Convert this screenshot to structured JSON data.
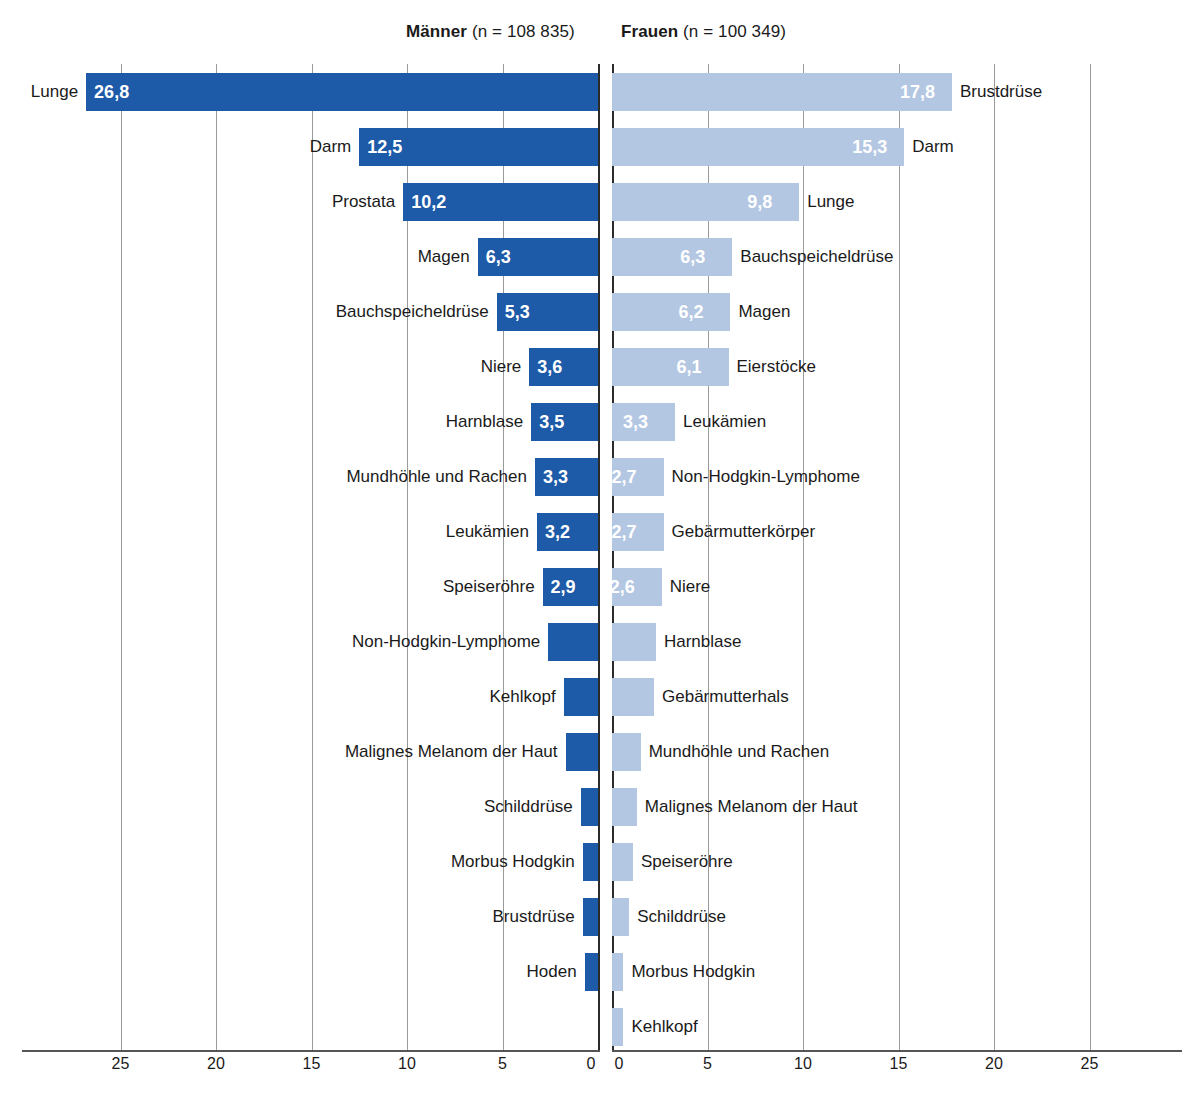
{
  "headers": {
    "left": {
      "who": "Männer",
      "n": "(n = 108 835)"
    },
    "right": {
      "who": "Frauen",
      "n": "(n = 100 349)"
    }
  },
  "axis": {
    "left_ticks": [
      "25",
      "20",
      "15",
      "10",
      "5",
      "0"
    ],
    "right_ticks": [
      "0",
      "5",
      "10",
      "15",
      "20",
      "25"
    ],
    "tick_values": [
      25,
      20,
      15,
      10,
      5,
      0
    ],
    "max": 28
  },
  "colors": {
    "male_bar": "#1d5aa8",
    "female_bar": "#b4c7e2",
    "grid": "#9a9a9a",
    "axis": "#2b2b2b",
    "text": "#1a1a1a"
  },
  "chart_data": {
    "type": "bar",
    "orientation": "horizontal-diverging",
    "title": "",
    "xlabel": "",
    "ylabel": "",
    "xlim": [
      0,
      28
    ],
    "grid": true,
    "legend_position": "top",
    "series": [
      {
        "name": "Männer",
        "n": "108 835",
        "side": "left",
        "color": "#1d5aa8",
        "points": [
          {
            "label": "Lunge",
            "value": 26.8,
            "value_text": "26,8",
            "label_shown": true
          },
          {
            "label": "Darm",
            "value": 12.5,
            "value_text": "12,5",
            "label_shown": true
          },
          {
            "label": "Prostata",
            "value": 10.2,
            "value_text": "10,2",
            "label_shown": true
          },
          {
            "label": "Magen",
            "value": 6.3,
            "value_text": "6,3",
            "label_shown": true
          },
          {
            "label": "Bauchspeicheldrüse",
            "value": 5.3,
            "value_text": "5,3",
            "label_shown": true
          },
          {
            "label": "Niere",
            "value": 3.6,
            "value_text": "3,6",
            "label_shown": true
          },
          {
            "label": "Harnblase",
            "value": 3.5,
            "value_text": "3,5",
            "label_shown": true
          },
          {
            "label": "Mundhöhle und Rachen",
            "value": 3.3,
            "value_text": "3,3",
            "label_shown": true
          },
          {
            "label": "Leukämien",
            "value": 3.2,
            "value_text": "3,2",
            "label_shown": true
          },
          {
            "label": "Speiseröhre",
            "value": 2.9,
            "value_text": "2,9",
            "label_shown": true
          },
          {
            "label": "Non-Hodgkin-Lymphome",
            "value": 2.6,
            "value_text": "",
            "label_shown": false
          },
          {
            "label": "Kehlkopf",
            "value": 1.8,
            "value_text": "",
            "label_shown": false
          },
          {
            "label": "Malignes Melanom der Haut",
            "value": 1.7,
            "value_text": "",
            "label_shown": false
          },
          {
            "label": "Schilddrüse",
            "value": 0.9,
            "value_text": "",
            "label_shown": false
          },
          {
            "label": "Morbus Hodgkin",
            "value": 0.8,
            "value_text": "",
            "label_shown": false
          },
          {
            "label": "Brustdrüse",
            "value": 0.8,
            "value_text": "",
            "label_shown": false
          },
          {
            "label": "Hoden",
            "value": 0.7,
            "value_text": "",
            "label_shown": false
          }
        ]
      },
      {
        "name": "Frauen",
        "n": "100 349",
        "side": "right",
        "color": "#b4c7e2",
        "points": [
          {
            "label": "Brustdrüse",
            "value": 17.8,
            "value_text": "17,8",
            "label_shown": true
          },
          {
            "label": "Darm",
            "value": 15.3,
            "value_text": "15,3",
            "label_shown": true
          },
          {
            "label": "Lunge",
            "value": 9.8,
            "value_text": "9,8",
            "label_shown": true
          },
          {
            "label": "Bauchspeicheldrüse",
            "value": 6.3,
            "value_text": "6,3",
            "label_shown": true
          },
          {
            "label": "Magen",
            "value": 6.2,
            "value_text": "6,2",
            "label_shown": true
          },
          {
            "label": "Eierstöcke",
            "value": 6.1,
            "value_text": "6,1",
            "label_shown": true
          },
          {
            "label": "Leukämien",
            "value": 3.3,
            "value_text": "3,3",
            "label_shown": true
          },
          {
            "label": "Non-Hodgkin-Lymphome",
            "value": 2.7,
            "value_text": "2,7",
            "label_shown": true
          },
          {
            "label": "Gebärmutterkörper",
            "value": 2.7,
            "value_text": "2,7",
            "label_shown": true
          },
          {
            "label": "Niere",
            "value": 2.6,
            "value_text": "2,6",
            "label_shown": true
          },
          {
            "label": "Harnblase",
            "value": 2.3,
            "value_text": "",
            "label_shown": false
          },
          {
            "label": "Gebärmutterhals",
            "value": 2.2,
            "value_text": "",
            "label_shown": false
          },
          {
            "label": "Mundhöhle und Rachen",
            "value": 1.5,
            "value_text": "",
            "label_shown": false
          },
          {
            "label": "Malignes Melanom der Haut",
            "value": 1.3,
            "value_text": "",
            "label_shown": false
          },
          {
            "label": "Speiseröhre",
            "value": 1.1,
            "value_text": "",
            "label_shown": false
          },
          {
            "label": "Schilddrüse",
            "value": 0.9,
            "value_text": "",
            "label_shown": false
          },
          {
            "label": "Morbus Hodgkin",
            "value": 0.6,
            "value_text": "",
            "label_shown": false
          },
          {
            "label": "Kehlkopf",
            "value": 0.6,
            "value_text": "",
            "label_shown": false
          }
        ]
      }
    ]
  }
}
